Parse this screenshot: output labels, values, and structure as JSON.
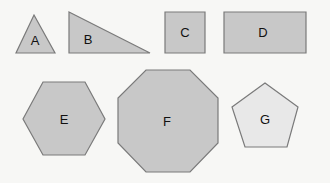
{
  "colors": {
    "background": "#f7f7f5",
    "fill_dark": "#c8c8c8",
    "fill_light": "#e8e8e8",
    "stroke": "#7a7a7a"
  },
  "shapes": [
    {
      "id": "A",
      "label": "A",
      "type": "triangle",
      "points": "34,15 55,53 16,53",
      "label_x": 35,
      "label_y": 45,
      "fill": "dark"
    },
    {
      "id": "B",
      "label": "B",
      "type": "right-triangle",
      "points": "69,12 150,53 69,53",
      "label_x": 88,
      "label_y": 44,
      "fill": "dark"
    },
    {
      "id": "C",
      "label": "C",
      "type": "square",
      "points": "165,12 205,12 205,53 165,53",
      "label_x": 185,
      "label_y": 37,
      "fill": "dark"
    },
    {
      "id": "D",
      "label": "D",
      "type": "rectangle",
      "points": "224,12 306,12 306,53 224,53",
      "label_x": 263,
      "label_y": 37,
      "fill": "dark"
    },
    {
      "id": "E",
      "label": "E",
      "type": "hexagon",
      "points": "43,82 85,82 105,119 85,155 43,155 23,119",
      "label_x": 64,
      "label_y": 124,
      "fill": "dark"
    },
    {
      "id": "F",
      "label": "F",
      "type": "octagon",
      "points": "146,70 190,70 218,98 218,143 190,172 146,172 118,143 118,98",
      "label_x": 167,
      "label_y": 126,
      "fill": "dark"
    },
    {
      "id": "G",
      "label": "G",
      "type": "pentagon",
      "points": "265,83 298,107 287,147 245,147 232,107",
      "label_x": 265,
      "label_y": 124,
      "fill": "light"
    }
  ]
}
